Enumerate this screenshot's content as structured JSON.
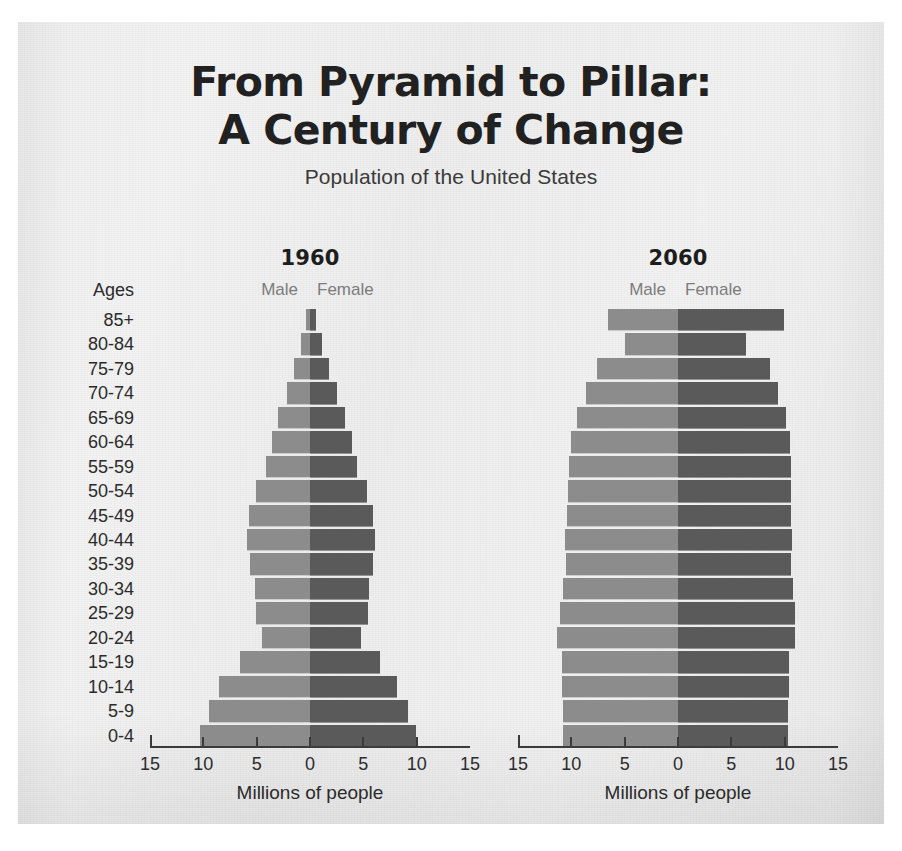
{
  "header": {
    "title_line1": "From Pyramid to Pillar:",
    "title_line2": "A Century of Change",
    "subtitle": "Population of the United States"
  },
  "axis": {
    "ages_header": "Ages",
    "x_title": "Millions of people",
    "x_ticks": [
      "15",
      "10",
      "5",
      "0",
      "5",
      "10",
      "15"
    ],
    "x_min": -15,
    "x_max": 15
  },
  "legend": {
    "male": "Male",
    "female": "Female"
  },
  "colors": {
    "male_bar": "#8c8c8c",
    "female_bar": "#5a5a5a",
    "axis": "#3b3b3b",
    "title_text": "#212121",
    "paper": "#f0f0f0"
  },
  "panels": [
    {
      "year": "1960"
    },
    {
      "year": "2060"
    }
  ],
  "chart_data": {
    "type": "bar",
    "title": "From Pyramid to Pillar: A Century of Change",
    "subtitle": "Population of the United States",
    "xlabel": "Millions of people",
    "ylabel": "Ages",
    "xlim": [
      -15,
      15
    ],
    "xticks": [
      15,
      10,
      5,
      0,
      5,
      10,
      15
    ],
    "grid": false,
    "legend": [
      "Male",
      "Female"
    ],
    "legend_position": "above-panel",
    "categories": [
      "85+",
      "80-84",
      "75-79",
      "70-74",
      "65-69",
      "60-64",
      "55-59",
      "50-54",
      "45-49",
      "40-44",
      "35-39",
      "30-34",
      "25-29",
      "20-24",
      "15-19",
      "10-14",
      "5-9",
      "0-4"
    ],
    "panels": [
      {
        "name": "1960",
        "series": [
          {
            "name": "Male",
            "side": "left",
            "values": [
              0.4,
              0.8,
              1.5,
              2.2,
              3.0,
              3.6,
              4.1,
              5.1,
              5.7,
              5.9,
              5.6,
              5.2,
              5.1,
              4.5,
              6.6,
              8.5,
              9.5,
              10.3
            ]
          },
          {
            "name": "Female",
            "side": "right",
            "values": [
              0.6,
              1.1,
              1.8,
              2.5,
              3.3,
              3.9,
              4.4,
              5.3,
              5.9,
              6.1,
              5.9,
              5.5,
              5.4,
              4.8,
              6.6,
              8.2,
              9.2,
              9.9
            ]
          }
        ]
      },
      {
        "name": "2060",
        "series": [
          {
            "name": "Male",
            "side": "left",
            "values": [
              6.6,
              5.0,
              7.6,
              8.6,
              9.5,
              10.0,
              10.2,
              10.3,
              10.4,
              10.6,
              10.5,
              10.8,
              11.1,
              11.3,
              10.9,
              10.9,
              10.8,
              10.8
            ]
          },
          {
            "name": "Female",
            "side": "right",
            "values": [
              9.9,
              6.4,
              8.6,
              9.4,
              10.1,
              10.5,
              10.6,
              10.6,
              10.6,
              10.7,
              10.6,
              10.8,
              11.0,
              11.0,
              10.4,
              10.4,
              10.3,
              10.3
            ]
          }
        ]
      }
    ]
  }
}
